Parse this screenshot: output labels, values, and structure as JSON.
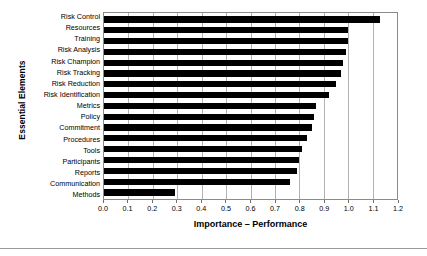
{
  "chart_data": {
    "type": "bar",
    "orientation": "horizontal",
    "title": "",
    "xlabel": "Importance – Performance",
    "ylabel": "Essential Elements",
    "xlim": [
      0.0,
      1.2
    ],
    "xticks": [
      "0.0",
      "0.1",
      "0.2",
      "0.3",
      "0.4",
      "0.5",
      "0.6",
      "0.7",
      "0.8",
      "0.9",
      "1.0",
      "1.1",
      "1.2"
    ],
    "grid": true,
    "legend": null,
    "bar_color": "#000000",
    "categories": [
      "Risk Control",
      "Resources",
      "Training",
      "Risk Analysis",
      "Risk Champion",
      "Risk Tracking",
      "Risk Reduction",
      "Risk Identification",
      "Metrics",
      "Policy",
      "Commitment",
      "Procedures",
      "Tools",
      "Participants",
      "Reports",
      "Communication",
      "Methods"
    ],
    "values": [
      1.13,
      1.0,
      1.0,
      0.99,
      0.98,
      0.97,
      0.95,
      0.92,
      0.87,
      0.86,
      0.85,
      0.83,
      0.81,
      0.8,
      0.79,
      0.76,
      0.29
    ]
  }
}
